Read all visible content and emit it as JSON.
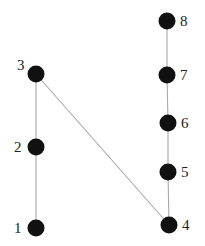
{
  "diagram": {
    "type": "graph",
    "colors": {
      "edge": "#a8a8a8",
      "node": "#111111",
      "label": "#222222",
      "background": "#ffffff"
    },
    "node_radius": 8.5,
    "nodes": [
      {
        "id": "1",
        "label": "1",
        "x": 36,
        "y": 228,
        "label_pos": "left"
      },
      {
        "id": "2",
        "label": "2",
        "x": 36,
        "y": 147,
        "label_pos": "left"
      },
      {
        "id": "3",
        "label": "3",
        "x": 36,
        "y": 74,
        "label_pos": "upper-left"
      },
      {
        "id": "4",
        "label": "4",
        "x": 169,
        "y": 225,
        "label_pos": "right"
      },
      {
        "id": "5",
        "label": "5",
        "x": 168,
        "y": 172,
        "label_pos": "right"
      },
      {
        "id": "6",
        "label": "6",
        "x": 168,
        "y": 123,
        "label_pos": "right"
      },
      {
        "id": "7",
        "label": "7",
        "x": 167,
        "y": 75,
        "label_pos": "right"
      },
      {
        "id": "8",
        "label": "8",
        "x": 167,
        "y": 21,
        "label_pos": "right"
      }
    ],
    "edges": [
      {
        "from": "1",
        "to": "2"
      },
      {
        "from": "2",
        "to": "3"
      },
      {
        "from": "3",
        "to": "4"
      },
      {
        "from": "4",
        "to": "5"
      },
      {
        "from": "5",
        "to": "6"
      },
      {
        "from": "6",
        "to": "7"
      },
      {
        "from": "7",
        "to": "8"
      }
    ]
  }
}
